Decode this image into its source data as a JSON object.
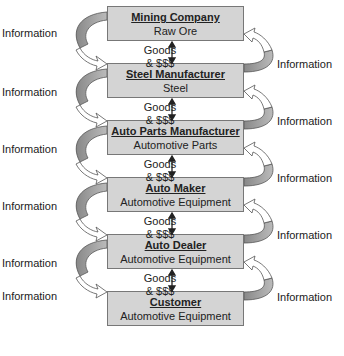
{
  "diagram": {
    "type": "supply-chain",
    "nodes": [
      {
        "title": "Mining Company",
        "subtitle": "Raw Ore"
      },
      {
        "title": "Steel Manufacturer",
        "subtitle": "Steel"
      },
      {
        "title": "Auto Parts Manufacturer",
        "subtitle": "Automotive Parts"
      },
      {
        "title": "Auto Maker",
        "subtitle": "Automotive Equipment"
      },
      {
        "title": "Auto Dealer",
        "subtitle": "Automotive Equipment"
      },
      {
        "title": "Customer",
        "subtitle": "Automotive Equipment"
      }
    ],
    "flow_label_line1": "Goods",
    "flow_label_line2": "& $$$",
    "info_label": "Information",
    "colors": {
      "box_fill": "#d4d4d4",
      "box_border": "#777777",
      "arrow_fill": "#9a9a9a",
      "arrow_outline": "#555555"
    }
  }
}
